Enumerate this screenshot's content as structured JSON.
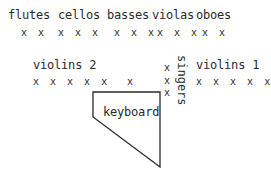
{
  "sections": {
    "flutes": {
      "label": "flutes",
      "players": "x x"
    },
    "cellos": {
      "label": "cellos",
      "players": "x x x"
    },
    "basses": {
      "label": "basses",
      "players": "x x x"
    },
    "violas": {
      "label": "violas",
      "players": "x x x"
    },
    "oboes": {
      "label": "oboes",
      "players": "x x"
    },
    "violins2": {
      "label": "violins 2",
      "players": "x x x x x"
    },
    "conductor": {
      "players": "x"
    },
    "singers": {
      "label": "singers",
      "players": [
        "x",
        "x",
        "x"
      ]
    },
    "violins1": {
      "label": "violins 1",
      "players": "x x x x x"
    },
    "keyboard": {
      "label": "keyboard"
    }
  }
}
